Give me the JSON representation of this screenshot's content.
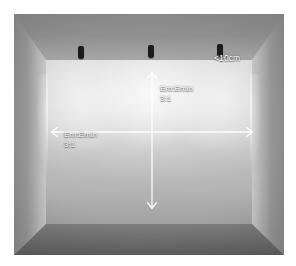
{
  "room": {
    "surfaces": {
      "ceiling_label": "ceiling",
      "back_wall_label": "back-wall",
      "floor_label": "floor",
      "left_wall_label": "left-wall",
      "right_wall_label": "right-wall"
    },
    "colors": {
      "ceiling": "#8f8f8f",
      "back_wall_lit": "#d6d6d6",
      "back_wall_base": "#b4b4b4",
      "floor": "#6a6a6a",
      "side_wall": "#9a9a9a",
      "luminaire": "#1b1b1b",
      "annotation": "#ffffff",
      "page_background": "#ffffff"
    }
  },
  "luminaires": [
    {
      "name": "wall-washer-left",
      "x_pct": 25.0,
      "y_pct": 14.9
    },
    {
      "name": "wall-washer-center",
      "x_pct": 50.4,
      "y_pct": 14.5
    },
    {
      "name": "wall-washer-right",
      "x_pct": 76.0,
      "y_pct": 14.1
    }
  ],
  "annotations": {
    "vertical_ratio": {
      "line1": "Em:Emin",
      "line2": "3:1",
      "axis": "vertical"
    },
    "horizontal_ratio": {
      "line1": "Em:Emin",
      "line2": "3:1",
      "axis": "horizontal"
    },
    "gap_callout": {
      "text": "<10cm",
      "describes": "distance from luminaire to wall"
    }
  },
  "arrows": {
    "vertical": {
      "x": 152,
      "y_top": 59,
      "y_bottom": 194,
      "head": "double"
    },
    "horizontal": {
      "y": 118,
      "x_left": 38,
      "x_right": 238,
      "head": "double"
    }
  }
}
